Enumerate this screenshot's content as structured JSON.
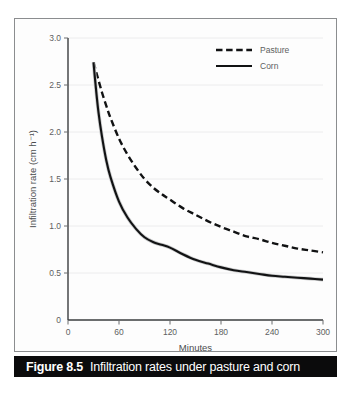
{
  "figure": {
    "caption_number": "Figure 8.5",
    "caption_text": "Infiltration rates under pasture and corn"
  },
  "chart_data": {
    "type": "line",
    "title": "",
    "xlabel": "Minutes",
    "ylabel": "Infiltration rate (cm h⁻¹)",
    "xlim": [
      0,
      300
    ],
    "ylim": [
      0,
      3.0
    ],
    "xticks": [
      0,
      60,
      120,
      180,
      240,
      300
    ],
    "xtick_labels": [
      "0",
      "60",
      "120",
      "180",
      "240",
      "300"
    ],
    "yticks": [
      0,
      0.5,
      1.0,
      1.5,
      2.0,
      2.5,
      3.0
    ],
    "ytick_labels": [
      "0",
      "0.5",
      "1.0",
      "1.5",
      "2.0",
      "2.5",
      "3.0"
    ],
    "grid": "horizontal",
    "legend_position": "top-right",
    "series": [
      {
        "name": "Pasture",
        "style": "dashed",
        "color": "#111213",
        "x": [
          30,
          35,
          40,
          45,
          50,
          60,
          70,
          80,
          90,
          100,
          110,
          120,
          135,
          150,
          165,
          180,
          195,
          210,
          225,
          240,
          255,
          270,
          285,
          300
        ],
        "values": [
          2.74,
          2.58,
          2.42,
          2.28,
          2.15,
          1.93,
          1.76,
          1.62,
          1.5,
          1.41,
          1.34,
          1.28,
          1.19,
          1.12,
          1.05,
          0.99,
          0.94,
          0.89,
          0.86,
          0.82,
          0.79,
          0.76,
          0.74,
          0.72
        ]
      },
      {
        "name": "Corn",
        "style": "solid",
        "color": "#111213",
        "x": [
          30,
          33,
          36,
          40,
          45,
          50,
          60,
          70,
          80,
          90,
          100,
          110,
          120,
          135,
          150,
          165,
          180,
          195,
          210,
          225,
          240,
          255,
          270,
          285,
          300
        ],
        "values": [
          2.74,
          2.45,
          2.2,
          1.95,
          1.7,
          1.52,
          1.26,
          1.09,
          0.97,
          0.88,
          0.83,
          0.8,
          0.77,
          0.7,
          0.64,
          0.6,
          0.56,
          0.53,
          0.51,
          0.49,
          0.47,
          0.46,
          0.45,
          0.44,
          0.43
        ]
      }
    ]
  }
}
